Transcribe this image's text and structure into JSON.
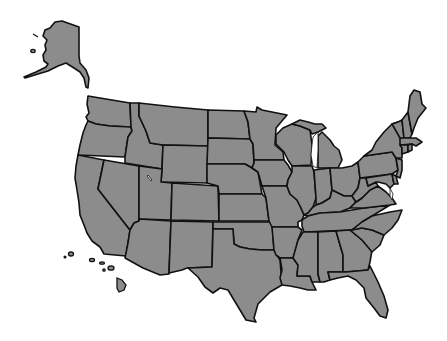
{
  "map": {
    "title": "United States map",
    "fill_color": "#8c8c8c",
    "border_color": "#111111",
    "background_color": "#ffffff",
    "regions": [
      "Alaska",
      "Hawaii",
      "Washington",
      "Oregon",
      "California",
      "Idaho",
      "Nevada",
      "Montana",
      "Wyoming",
      "Utah",
      "Arizona",
      "Colorado",
      "New Mexico",
      "North Dakota",
      "South Dakota",
      "Nebraska",
      "Kansas",
      "Oklahoma",
      "Texas",
      "Minnesota",
      "Iowa",
      "Missouri",
      "Arkansas",
      "Louisiana",
      "Wisconsin",
      "Illinois",
      "Michigan",
      "Indiana",
      "Ohio",
      "Kentucky",
      "Tennessee",
      "Mississippi",
      "Alabama",
      "Georgia",
      "Florida",
      "South Carolina",
      "North Carolina",
      "Virginia",
      "West Virginia",
      "Maryland",
      "Delaware",
      "Pennsylvania",
      "New Jersey",
      "New York",
      "Connecticut",
      "Rhode Island",
      "Massachusetts",
      "Vermont",
      "New Hampshire",
      "Maine"
    ]
  }
}
